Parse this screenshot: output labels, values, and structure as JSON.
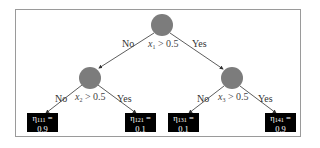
{
  "diagram": {
    "type": "decision-tree",
    "colors": {
      "node": "#7c7c7c",
      "leaf_bg": "#000000",
      "leaf_text": "#ffffff",
      "edge": "#333333",
      "frame": "#9a9a9a"
    },
    "root": {
      "condition": {
        "var": "x",
        "sub": "1",
        "op": "> 0.5"
      },
      "no_label": "No",
      "yes_label": "Yes"
    },
    "left": {
      "condition": {
        "var": "x",
        "sub": "2",
        "op": "> 0.5"
      },
      "no_label": "No",
      "yes_label": "Yes"
    },
    "right": {
      "condition": {
        "var": "x",
        "sub": "3",
        "op": "> 0.5"
      },
      "no_label": "No",
      "yes_label": "Yes"
    },
    "leaves": [
      {
        "symbol": "η",
        "sub": "111",
        "eq": " =",
        "value": "0.9"
      },
      {
        "symbol": "η",
        "sub": "121",
        "eq": " =",
        "value": "0.1"
      },
      {
        "symbol": "η",
        "sub": "131",
        "eq": " =",
        "value": "0.1"
      },
      {
        "symbol": "η",
        "sub": "141",
        "eq": " =",
        "value": "0.9"
      }
    ]
  }
}
